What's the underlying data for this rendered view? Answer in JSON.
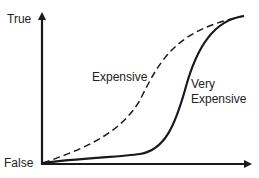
{
  "diagram": {
    "type": "concept-graph",
    "y_axis": {
      "top_label": "True",
      "bottom_label": "False"
    },
    "x_axis": {
      "label": ""
    },
    "curves": [
      {
        "name": "Expensive",
        "style": "dashed",
        "label": "Expensive",
        "description": "rises gradually from origin, S-shaped, reaching True earlier"
      },
      {
        "name": "Very Expensive",
        "style": "solid",
        "label_line1": "Very",
        "label_line2": "Expensive",
        "description": "stays near False for longer, then rises steeply to True"
      }
    ],
    "stroke_color": "#1a1a1a"
  }
}
